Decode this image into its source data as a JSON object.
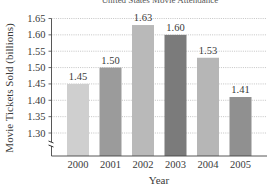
{
  "chart_data": {
    "type": "bar",
    "title": "United States Movie Attendance",
    "xlabel": "Year",
    "ylabel": "Movie Tickets Sold (billions)",
    "categories": [
      "2000",
      "2001",
      "2002",
      "2003",
      "2004",
      "2005"
    ],
    "values": [
      1.45,
      1.5,
      1.63,
      1.6,
      1.53,
      1.41
    ],
    "value_labels": [
      "1.45",
      "1.50",
      "1.63",
      "1.60",
      "1.53",
      "1.41"
    ],
    "bar_colors": [
      "#cfcfcf",
      "#9b9b9b",
      "#b9b9b9",
      "#7b7b7b",
      "#b6b6b6",
      "#909090"
    ],
    "ylim": [
      1.25,
      1.65
    ],
    "yticks": [
      1.3,
      1.35,
      1.4,
      1.45,
      1.5,
      1.55,
      1.6,
      1.65
    ],
    "ytick_labels": [
      "1.30",
      "1.35",
      "1.40",
      "1.45",
      "1.50",
      "1.55",
      "1.60",
      "1.65"
    ],
    "grid": true,
    "grid_style": "dotted",
    "axis_break": true,
    "legend": null
  }
}
